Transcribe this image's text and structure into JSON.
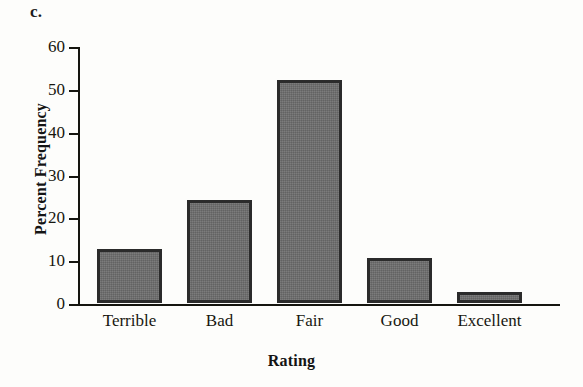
{
  "figure": {
    "panel_label": "c.",
    "background_color": "#fdfdfb",
    "axis_color": "#15150f"
  },
  "chart_data": {
    "type": "bar",
    "title": "",
    "subtitle": "",
    "xlabel": "Rating",
    "ylabel": "Percent Frequency",
    "categories": [
      "Terrible",
      "Bad",
      "Fair",
      "Good",
      "Excellent"
    ],
    "values": [
      12.5,
      24,
      52,
      10.5,
      2.5
    ],
    "ylim": [
      0,
      60
    ],
    "yticks": [
      0,
      10,
      20,
      30,
      40,
      50,
      60
    ],
    "ytick_labels": [
      "0",
      "10",
      "20",
      "30",
      "40",
      "50",
      "60"
    ],
    "grid": false,
    "legend": false,
    "legend_position": "none",
    "bar_fill_color": "#6d6d6d",
    "bar_edge_color": "#2b2b2b",
    "tick_direction": "out"
  }
}
